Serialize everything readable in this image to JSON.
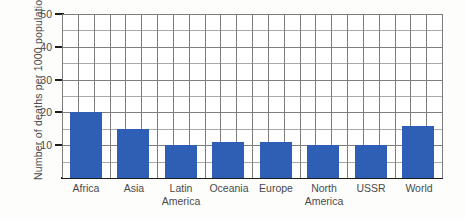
{
  "chart_data": {
    "type": "bar",
    "title": "",
    "subtitle": "",
    "xlabel": "",
    "ylabel": "Number of deaths per 1000 population",
    "categories": [
      "Africa",
      "Asia",
      "Latin America",
      "Oceania",
      "Europe",
      "North America",
      "USSR",
      "World"
    ],
    "values": [
      20,
      15,
      10,
      11,
      11,
      10,
      10,
      16
    ],
    "ylim": [
      0,
      50
    ],
    "yticks": [
      10,
      20,
      30,
      40,
      50
    ],
    "ytick_labels": [
      "10",
      "20",
      "30",
      "40",
      "50"
    ],
    "minor_ytick_step": 5,
    "grid": true,
    "legend": null,
    "bar_color": "#2f5fb4",
    "grid_color": "#7d7d7d",
    "axis_color": "#1d1d1d"
  },
  "axis": {
    "y_title": "Number of deaths per 1000 population"
  },
  "category_labels": [
    {
      "line1": "Africa",
      "line2": ""
    },
    {
      "line1": "Asia",
      "line2": ""
    },
    {
      "line1": "Latin",
      "line2": "America"
    },
    {
      "line1": "Oceania",
      "line2": ""
    },
    {
      "line1": "Europe",
      "line2": ""
    },
    {
      "line1": "North",
      "line2": "America"
    },
    {
      "line1": "USSR",
      "line2": ""
    },
    {
      "line1": "World",
      "line2": ""
    }
  ],
  "ytick_labels": [
    "10",
    "20",
    "30",
    "40",
    "50"
  ]
}
